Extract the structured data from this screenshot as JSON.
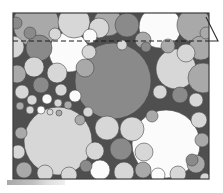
{
  "figure": {
    "kind": "scientific-illustration",
    "width": 223,
    "height": 193,
    "caption_smudge": ""
  },
  "frame": {
    "left": 13,
    "top": 13,
    "right": 209,
    "bottom": 179,
    "border_color": "#3d3d3d",
    "border_width": 1,
    "background_color": "#4f4f4f"
  },
  "dashed_line": {
    "label": "reference-level-dashed-line",
    "x1": 13,
    "x2": 209,
    "y": 41,
    "color": "#1d1d1d",
    "dash": "5 3",
    "width": 1
  },
  "corner_marker": {
    "label": "shear-direction-arrow",
    "color": "#2b2b2b",
    "points": "206,17 218,41 209,41",
    "stroke_width": 1,
    "tip_x": 218,
    "tip_y": 41
  },
  "palette": {
    "background": "#4f4f4f",
    "white": "#fbfbfb",
    "light": "#d7d7d7",
    "mid": "#a9a9a9",
    "dark": "#8a8a8a",
    "outline": "#4a4a4a",
    "frame": "#3d3d3d",
    "page": "#ffffff"
  },
  "chart_data": {
    "type": "scatter",
    "xlabel": "",
    "ylabel": "",
    "xlim": [
      13,
      209
    ],
    "ylim": [
      13,
      179
    ],
    "grid": false,
    "legend": "none",
    "annotations": [
      {
        "name": "dashed-reference-line",
        "y": 41,
        "style": "dashed"
      },
      {
        "name": "corner-arrow",
        "x": 218,
        "y": 41,
        "style": "triangle"
      }
    ],
    "series": [
      {
        "name": "discs",
        "fields": [
          "cx",
          "cy",
          "r",
          "shade"
        ],
        "values": [
          [
            36,
            24,
            23,
            "mid"
          ],
          [
            74,
            22,
            16,
            "light"
          ],
          [
            108,
            22,
            14,
            "mid"
          ],
          [
            127,
            25,
            12,
            "dark"
          ],
          [
            160,
            27,
            21,
            "white"
          ],
          [
            194,
            25,
            17,
            "mid"
          ],
          [
            13,
            47,
            11,
            "light"
          ],
          [
            39,
            48,
            13,
            "dark"
          ],
          [
            69,
            52,
            20,
            "white"
          ],
          [
            99,
            28,
            10,
            "light"
          ],
          [
            186,
            53,
            9,
            "light"
          ],
          [
            201,
            48,
            12,
            "mid"
          ],
          [
            34,
            67,
            10,
            "light"
          ],
          [
            57,
            73,
            10,
            "light"
          ],
          [
            17,
            74,
            9,
            "mid"
          ],
          [
            113,
            81,
            38,
            "dark"
          ],
          [
            176,
            69,
            20,
            "light"
          ],
          [
            203,
            78,
            15,
            "mid"
          ],
          [
            41,
            85,
            8,
            "dark"
          ],
          [
            61,
            90,
            6,
            "light"
          ],
          [
            22,
            92,
            7,
            "light"
          ],
          [
            75,
            96,
            6,
            "white"
          ],
          [
            160,
            92,
            7,
            "light"
          ],
          [
            180,
            95,
            8,
            "dark"
          ],
          [
            196,
            100,
            7,
            "light"
          ],
          [
            32,
            100,
            5,
            "light"
          ],
          [
            47,
            99,
            5,
            "white"
          ],
          [
            58,
            103,
            4,
            "light"
          ],
          [
            68,
            105,
            4,
            "mid"
          ],
          [
            20,
            106,
            4,
            "mid"
          ],
          [
            30,
            110,
            4,
            "light"
          ],
          [
            41,
            110,
            4,
            "white"
          ],
          [
            50,
            112,
            3,
            "light"
          ],
          [
            59,
            113,
            3,
            "mid"
          ],
          [
            58,
            141,
            34,
            "light"
          ],
          [
            166,
            144,
            34,
            "white"
          ],
          [
            107,
            128,
            12,
            "light"
          ],
          [
            132,
            129,
            12,
            "light"
          ],
          [
            121,
            149,
            11,
            "dark"
          ],
          [
            95,
            151,
            9,
            "light"
          ],
          [
            144,
            152,
            9,
            "light"
          ],
          [
            100,
            170,
            10,
            "white"
          ],
          [
            124,
            172,
            10,
            "light"
          ],
          [
            143,
            170,
            8,
            "mid"
          ],
          [
            86,
            166,
            6,
            "dark"
          ],
          [
            21,
            133,
            6,
            "mid"
          ],
          [
            18,
            152,
            7,
            "light"
          ],
          [
            24,
            170,
            8,
            "mid"
          ],
          [
            45,
            173,
            8,
            "light"
          ],
          [
            69,
            175,
            8,
            "light"
          ],
          [
            199,
            120,
            8,
            "light"
          ],
          [
            202,
            140,
            7,
            "mid"
          ],
          [
            196,
            164,
            9,
            "mid"
          ],
          [
            178,
            174,
            8,
            "light"
          ],
          [
            158,
            175,
            7,
            "white"
          ],
          [
            90,
            36,
            7,
            "white"
          ],
          [
            143,
            40,
            8,
            "mid"
          ],
          [
            55,
            34,
            6,
            "light"
          ],
          [
            192,
            160,
            6,
            "dark"
          ],
          [
            80,
            120,
            5,
            "mid"
          ],
          [
            88,
            112,
            5,
            "light"
          ],
          [
            152,
            116,
            6,
            "mid"
          ],
          [
            146,
            47,
            5,
            "dark"
          ],
          [
            122,
            45,
            5,
            "light"
          ],
          [
            16,
            23,
            6,
            "dark"
          ],
          [
            206,
            33,
            6,
            "mid"
          ],
          [
            85,
            68,
            9,
            "mid"
          ],
          [
            89,
            52,
            7,
            "light"
          ],
          [
            30,
            33,
            6,
            "dark"
          ],
          [
            168,
            46,
            7,
            "mid"
          ],
          [
            205,
            178,
            5,
            "light"
          ]
        ]
      }
    ]
  }
}
